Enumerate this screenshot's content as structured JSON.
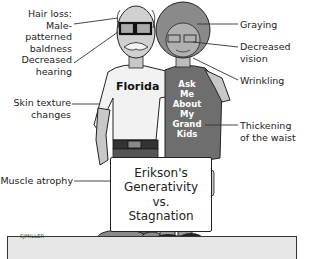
{
  "labels_left": [
    {
      "id": "hair-loss",
      "text": "Hair loss:\nMale-patterned\nbaldness"
    },
    {
      "id": "decreased-hearing",
      "text": "Decreased\nhearing"
    },
    {
      "id": "skin-texture",
      "text": "Skin texture\nchanges"
    },
    {
      "id": "muscle-atrophy",
      "text": "Muscle atrophy"
    }
  ],
  "labels_right": [
    {
      "id": "graying",
      "text": "Graying"
    },
    {
      "id": "decreased-vision",
      "text": "Decreased vision"
    },
    {
      "id": "wrinkling",
      "text": "Wrinkling"
    },
    {
      "id": "thickening-waist",
      "text": "Thickening\nof the waist"
    }
  ],
  "man": {
    "shirt_text": "Florida"
  },
  "woman": {
    "shirt_text": "Ask\nMe\nAbout\nMy\nGrand\nKids"
  },
  "sign": {
    "line1": "Erikson's",
    "line2": "Generativity",
    "line3": "vs.",
    "line4": "Stagnation"
  },
  "signature": "SJMILLER",
  "colors": {
    "man_shirt": "#f2f2f2",
    "woman_shirt": "#6e6e6e",
    "woman_hair": "#8a8a8a",
    "skin": "#c8c8c8",
    "pants": "#7a7a7a",
    "floor": "#e6e6e6"
  }
}
